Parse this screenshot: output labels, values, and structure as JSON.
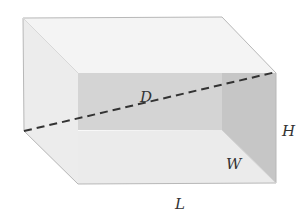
{
  "diagram": {
    "type": "rectangular-box-space-diagonal",
    "labels": {
      "diagonal": "D",
      "height": "H",
      "width": "W",
      "length": "L"
    },
    "colors": {
      "top_face": "#f3f3f3",
      "left_face": "#ececec",
      "back_face": "#cdcdcd",
      "right_inner_face": "#bdbdbd",
      "bottom_face": "#e6e6e6",
      "edge": "#b5b5b5",
      "diagonal": "#333333"
    }
  }
}
